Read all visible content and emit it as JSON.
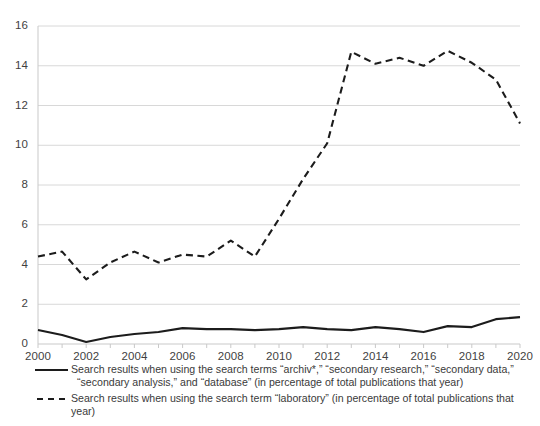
{
  "chart_data": {
    "type": "line",
    "title": "",
    "xlabel": "",
    "ylabel": "",
    "x": [
      2000,
      2001,
      2002,
      2003,
      2004,
      2005,
      2006,
      2007,
      2008,
      2009,
      2010,
      2011,
      2012,
      2013,
      2014,
      2015,
      2016,
      2017,
      2018,
      2019,
      2020
    ],
    "xlim": [
      2000,
      2020
    ],
    "ylim": [
      0,
      16
    ],
    "xticks": [
      "2000",
      "2002",
      "2004",
      "2006",
      "2008",
      "2010",
      "2012",
      "2014",
      "2016",
      "2018",
      "2020"
    ],
    "yticks": [
      "0",
      "2",
      "4",
      "6",
      "8",
      "10",
      "12",
      "14",
      "16"
    ],
    "grid": "horizontal",
    "legend_position": "below",
    "series": [
      {
        "name": "archiv-secondary-database",
        "style": "solid",
        "color": "#1c1c1c",
        "values": [
          0.7,
          0.45,
          0.1,
          0.35,
          0.5,
          0.6,
          0.8,
          0.75,
          0.75,
          0.7,
          0.75,
          0.85,
          0.75,
          0.7,
          0.85,
          0.75,
          0.6,
          0.9,
          0.85,
          1.25,
          1.35
        ]
      },
      {
        "name": "laboratory",
        "style": "dashed",
        "color": "#1c1c1c",
        "values": [
          4.4,
          4.65,
          3.25,
          4.1,
          4.65,
          4.1,
          4.5,
          4.4,
          5.2,
          4.4,
          6.3,
          8.3,
          10.1,
          14.7,
          14.1,
          14.4,
          14.0,
          14.75,
          14.15,
          13.3,
          11.1
        ]
      }
    ]
  },
  "legend": {
    "entries": [
      {
        "swatch": "solid-line",
        "line1": "Search results when using the search terms “archiv*,” “secondary research,” “secondary data,”",
        "line2": "“secondary analysis,” and “database” (in percentage of total publications that year)"
      },
      {
        "swatch": "dashed-line",
        "line1": "Search results when using the search term “laboratory” (in percentage of total publications that year)",
        "line2": ""
      }
    ]
  },
  "colors": {
    "line": "#1c1c1c",
    "grid": "#d8d8d8",
    "axis": "#c9c9c9",
    "text": "#3a3a3a",
    "background": "#ffffff"
  }
}
